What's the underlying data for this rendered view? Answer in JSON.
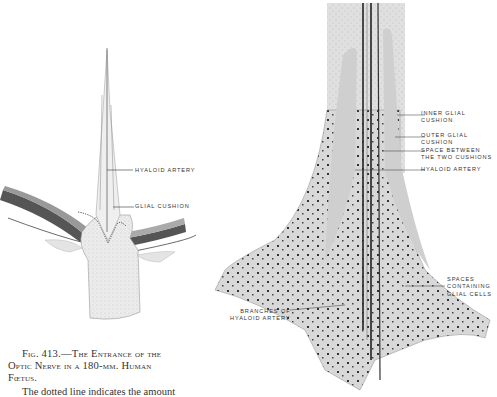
{
  "figure": {
    "number": "413",
    "caption_line1": "Fig. 413.—The Entrance of the",
    "caption_line2": "Optic Nerve in a 180-mm. Human",
    "caption_line3": "Fœtus.",
    "body_text": "The dotted line indicates the amount"
  },
  "left_diagram": {
    "labels": {
      "hyaloid_artery": "HYALOID ARTERY",
      "glial_cushion": "GLIAL CUSHION"
    }
  },
  "right_diagram": {
    "labels": {
      "inner_glial_cushion": "INNER GLIAL\nCUSHION",
      "outer_glial_cushion": "OUTER GLIAL\nCUSHION",
      "space_between": "SPACE BETWEEN\nTHE TWO CUSHIONS",
      "hyaloid_artery": "HYALOID ARTERY",
      "spaces_containing": "SPACES\nCONTAINING\nGLIAL CELLS",
      "branches": "BRANCHES OF\nHYALOID ARTERY"
    }
  }
}
